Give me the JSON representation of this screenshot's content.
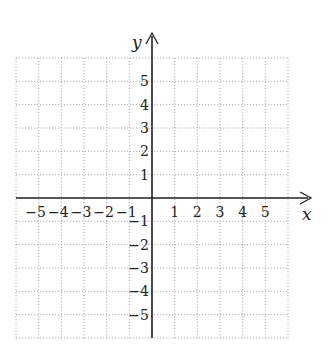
{
  "chart_data": {
    "type": "coordinate-grid",
    "title": "",
    "xlabel": "x",
    "ylabel": "y",
    "xlim": [
      -6,
      6
    ],
    "ylim": [
      -6,
      6
    ],
    "grid": true,
    "grid_style": "dotted",
    "x_ticks": [
      -5,
      -4,
      -3,
      -2,
      -1,
      1,
      2,
      3,
      4,
      5
    ],
    "y_ticks": [
      5,
      4,
      3,
      2,
      1,
      -1,
      -2,
      -3,
      -4,
      -5
    ],
    "x_tick_labels": [
      "−5",
      "−4",
      "−3",
      "−2",
      "−1",
      "1",
      "2",
      "3",
      "4",
      "5"
    ],
    "y_tick_labels": [
      "5",
      "4",
      "3",
      "2",
      "1",
      "−1",
      "−2",
      "−3",
      "−4",
      "−5"
    ]
  },
  "colors": {
    "grid": "#9a9a9a",
    "axis": "#222222"
  }
}
